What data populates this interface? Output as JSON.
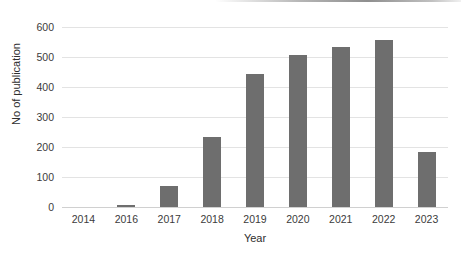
{
  "chart_data": {
    "type": "bar",
    "title": "",
    "xlabel": "Year",
    "ylabel": "No of publication",
    "categories": [
      "2014",
      "2016",
      "2017",
      "2018",
      "2019",
      "2020",
      "2021",
      "2022",
      "2023"
    ],
    "values": [
      0,
      7,
      70,
      233,
      442,
      508,
      535,
      558,
      182
    ],
    "ylim": [
      0,
      600
    ],
    "yticks": [
      0,
      100,
      200,
      300,
      400,
      500,
      600
    ],
    "ytick_labels": [
      "0",
      "100",
      "200",
      "300",
      "400",
      "500",
      "600"
    ],
    "grid": true,
    "grid_axis": "y",
    "legend": false,
    "legend_position": "none",
    "bar_color": "#6e6e6e",
    "gridline_color": "#e3e3e3",
    "background_color": "#ffffff",
    "tick_label_color": "#3b3b3b",
    "axis_title_color": "#2e2e2e"
  },
  "artifact": {
    "name": "scan-line",
    "color": "#787878"
  }
}
